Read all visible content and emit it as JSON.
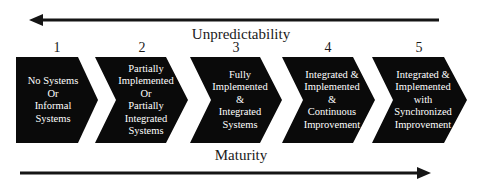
{
  "top_arrow": {
    "label": "Unpredictability",
    "direction": "left"
  },
  "bottom_arrow": {
    "label": "Maturity",
    "direction": "right"
  },
  "stages": [
    {
      "number": "1",
      "text": "No Systems\nOr\nInformal\nSystems"
    },
    {
      "number": "2",
      "text": "Partially\nImplemented\nOr\nPartially\nIntegrated\nSystems"
    },
    {
      "number": "3",
      "text": "Fully\nImplemented\n&\nIntegrated\nSystems"
    },
    {
      "number": "4",
      "text": "Integrated &\nImplemented\n&\nContinuous\nImprovement"
    },
    {
      "number": "5",
      "text": "Integrated &\nImplemented\nwith\nSynchronized\nImprovement"
    }
  ],
  "colors": {
    "chevron": "#0a0a0a",
    "arrow": "#151515",
    "text_on_chevron": "#ffffff"
  }
}
